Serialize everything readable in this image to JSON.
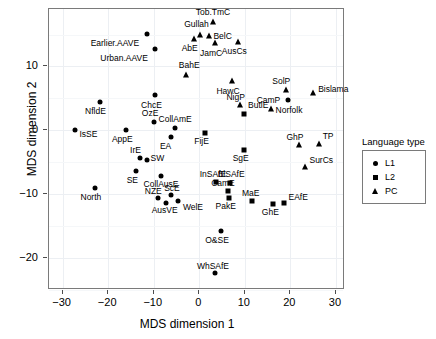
{
  "chart_data": {
    "type": "scatter",
    "title": "",
    "xlabel": "MDS dimension 1",
    "ylabel": "MDS dimension 2",
    "xlim": [
      -33,
      32
    ],
    "ylim": [
      -25,
      19
    ],
    "xticks": [
      -30,
      -20,
      -10,
      0,
      10,
      20,
      30
    ],
    "xticklabels": [
      "−30",
      "−20",
      "−10",
      "0",
      "10",
      "20",
      "30"
    ],
    "yticks": [
      10,
      0,
      -10,
      -20
    ],
    "yticklabels": [
      "10",
      "0",
      "−10",
      "−20"
    ],
    "grid": true,
    "legend": {
      "title": "Language type",
      "position": "right",
      "entries": [
        {
          "label": "L1",
          "marker": "circle",
          "key": "L1"
        },
        {
          "label": "L2",
          "marker": "square",
          "key": "L2"
        },
        {
          "label": "PC",
          "marker": "triangle",
          "key": "PC"
        }
      ]
    },
    "points": [
      {
        "label": "Earlier.AAVE",
        "x": -11.5,
        "y": 15.1,
        "type": "L1",
        "lx": -13.2,
        "ly": 13.6,
        "anchor": "end"
      },
      {
        "label": "Urban.AAVE",
        "x": -9.8,
        "y": 12.8,
        "type": "L1",
        "lx": -11.3,
        "ly": 11.3,
        "anchor": "end"
      },
      {
        "label": "Gullah",
        "x": 0.2,
        "y": 15.0,
        "type": "PC",
        "lx": -0.6,
        "ly": 16.6,
        "anchor": "middle"
      },
      {
        "label": "AbE",
        "x": -1.1,
        "y": 14.3,
        "type": "PC",
        "lx": -2.1,
        "ly": 12.9,
        "anchor": "middle"
      },
      {
        "label": "Tob.TmC",
        "x": 3.0,
        "y": 17.0,
        "type": "PC",
        "lx": 3.0,
        "ly": 18.5,
        "anchor": "middle"
      },
      {
        "label": "BelC",
        "x": 2.1,
        "y": 14.8,
        "type": "PC",
        "lx": 3.1,
        "ly": 14.8,
        "anchor": "start"
      },
      {
        "label": "JamC",
        "x": 3.4,
        "y": 13.6,
        "type": "PC",
        "lx": 2.6,
        "ly": 12.1,
        "anchor": "middle"
      },
      {
        "label": "AusCs",
        "x": 8.6,
        "y": 13.9,
        "type": "PC",
        "lx": 7.7,
        "ly": 12.4,
        "anchor": "middle"
      },
      {
        "label": "BahE",
        "x": -2.9,
        "y": 8.7,
        "type": "PC",
        "lx": -2.2,
        "ly": 10.2,
        "anchor": "middle"
      },
      {
        "label": "HawC",
        "x": 7.1,
        "y": 7.7,
        "type": "PC",
        "lx": 6.3,
        "ly": 6.2,
        "anchor": "middle"
      },
      {
        "label": "SolP",
        "x": 19.0,
        "y": 6.3,
        "type": "PC",
        "lx": 18.0,
        "ly": 7.8,
        "anchor": "middle"
      },
      {
        "label": "Bislama",
        "x": 25.0,
        "y": 5.8,
        "type": "PC",
        "lx": 26.1,
        "ly": 6.4,
        "anchor": "start"
      },
      {
        "label": "NigP",
        "x": 9.0,
        "y": 3.9,
        "type": "PC",
        "lx": 8.0,
        "ly": 5.2,
        "anchor": "middle"
      },
      {
        "label": "CamP",
        "x": 15.7,
        "y": 3.3,
        "type": "PC",
        "lx": 15.2,
        "ly": 4.7,
        "anchor": "middle"
      },
      {
        "label": "Norfolk",
        "x": 19.5,
        "y": 4.7,
        "type": "L1",
        "lx": 19.7,
        "ly": 3.2,
        "anchor": "middle"
      },
      {
        "label": "ButlE",
        "x": 9.8,
        "y": 2.6,
        "type": "L2",
        "lx": 10.7,
        "ly": 3.9,
        "anchor": "start"
      },
      {
        "label": "NfldE",
        "x": -21.8,
        "y": 4.4,
        "type": "L1",
        "lx": -22.8,
        "ly": 3.0,
        "anchor": "middle"
      },
      {
        "label": "ChcE",
        "x": -9.7,
        "y": 5.5,
        "type": "L1",
        "lx": -10.5,
        "ly": 4.0,
        "anchor": "middle"
      },
      {
        "label": "OzE",
        "x": -10.0,
        "y": 1.3,
        "type": "L1",
        "lx": -10.8,
        "ly": 2.7,
        "anchor": "middle"
      },
      {
        "label": "CollAmE",
        "x": -5.3,
        "y": 0.4,
        "type": "L1",
        "lx": -5.3,
        "ly": 1.8,
        "anchor": "middle"
      },
      {
        "label": "IsSE",
        "x": -27.2,
        "y": 0.1,
        "type": "L1",
        "lx": -26.3,
        "ly": -0.6,
        "anchor": "start"
      },
      {
        "label": "AppE",
        "x": -16.2,
        "y": 0.1,
        "type": "L1",
        "lx": -16.9,
        "ly": -1.4,
        "anchor": "middle"
      },
      {
        "label": "EA",
        "x": -6.3,
        "y": -1.1,
        "type": "L1",
        "lx": -7.4,
        "ly": -2.4,
        "anchor": "middle"
      },
      {
        "label": "FijE",
        "x": 1.3,
        "y": -0.4,
        "type": "L2",
        "lx": 0.5,
        "ly": -1.7,
        "anchor": "middle"
      },
      {
        "label": "SgE",
        "x": 9.9,
        "y": -3.0,
        "type": "L2",
        "lx": 9.1,
        "ly": -4.3,
        "anchor": "middle"
      },
      {
        "label": "GhP",
        "x": 21.8,
        "y": -2.3,
        "type": "PC",
        "lx": 21.0,
        "ly": -1.0,
        "anchor": "middle"
      },
      {
        "label": "TP",
        "x": 26.2,
        "y": -2.2,
        "type": "PC",
        "lx": 27.1,
        "ly": -0.9,
        "anchor": "start"
      },
      {
        "label": "SurCs",
        "x": 23.3,
        "y": -5.7,
        "type": "PC",
        "lx": 24.2,
        "ly": -4.6,
        "anchor": "start"
      },
      {
        "label": "IrE",
        "x": -13.0,
        "y": -4.3,
        "type": "L1",
        "lx": -14.0,
        "ly": -3.1,
        "anchor": "middle"
      },
      {
        "label": "SW",
        "x": -11.5,
        "y": -4.7,
        "type": "L1",
        "lx": -10.7,
        "ly": -4.4,
        "anchor": "start"
      },
      {
        "label": "SE",
        "x": -13.8,
        "y": -6.4,
        "type": "L1",
        "lx": -14.7,
        "ly": -7.7,
        "anchor": "middle"
      },
      {
        "label": "CollAusE",
        "x": -8.4,
        "y": -7.2,
        "type": "L1",
        "lx": -8.4,
        "ly": -8.4,
        "anchor": "middle"
      },
      {
        "label": "North",
        "x": -22.9,
        "y": -9.1,
        "type": "L1",
        "lx": -23.8,
        "ly": -10.4,
        "anchor": "middle"
      },
      {
        "label": "NZE",
        "x": -9.0,
        "y": -10.6,
        "type": "L1",
        "lx": -10.1,
        "ly": -9.5,
        "anchor": "middle"
      },
      {
        "label": "ScE",
        "x": -6.2,
        "y": -10.2,
        "type": "L1",
        "lx": -6.0,
        "ly": -9.0,
        "anchor": "middle"
      },
      {
        "label": "AusVE",
        "x": -7.4,
        "y": -11.3,
        "type": "L1",
        "lx": -7.6,
        "ly": -12.5,
        "anchor": "middle"
      },
      {
        "label": "WelE",
        "x": -4.6,
        "y": -11.0,
        "type": "L1",
        "lx": -3.6,
        "ly": -12.0,
        "anchor": "start"
      },
      {
        "label": "InSAfE",
        "x": 3.7,
        "y": -8.1,
        "type": "L2",
        "lx": 3.0,
        "ly": -6.9,
        "anchor": "middle"
      },
      {
        "label": "BlSAfE",
        "x": 6.7,
        "y": -8.2,
        "type": "L2",
        "lx": 7.0,
        "ly": -6.9,
        "anchor": "middle"
      },
      {
        "label": "CamE",
        "x": 6.2,
        "y": -9.5,
        "type": "L2",
        "lx": 5.2,
        "ly": -8.3,
        "anchor": "middle"
      },
      {
        "label": "PakE",
        "x": 6.5,
        "y": -10.6,
        "type": "L2",
        "lx": 5.8,
        "ly": -11.8,
        "anchor": "middle"
      },
      {
        "label": "MaE",
        "x": 11.6,
        "y": -11.1,
        "type": "L2",
        "lx": 11.3,
        "ly": -9.8,
        "anchor": "middle"
      },
      {
        "label": "GhE",
        "x": 16.2,
        "y": -11.5,
        "type": "L2",
        "lx": 15.6,
        "ly": -12.8,
        "anchor": "middle"
      },
      {
        "label": "EAfE",
        "x": 18.6,
        "y": -11.3,
        "type": "L2",
        "lx": 19.6,
        "ly": -10.5,
        "anchor": "start"
      },
      {
        "label": "O&SE",
        "x": 4.7,
        "y": -15.8,
        "type": "L1",
        "lx": 3.9,
        "ly": -17.1,
        "anchor": "middle"
      },
      {
        "label": "WhSAfE",
        "x": 3.5,
        "y": -22.4,
        "type": "L1",
        "lx": 3.0,
        "ly": -21.2,
        "anchor": "middle"
      }
    ]
  }
}
